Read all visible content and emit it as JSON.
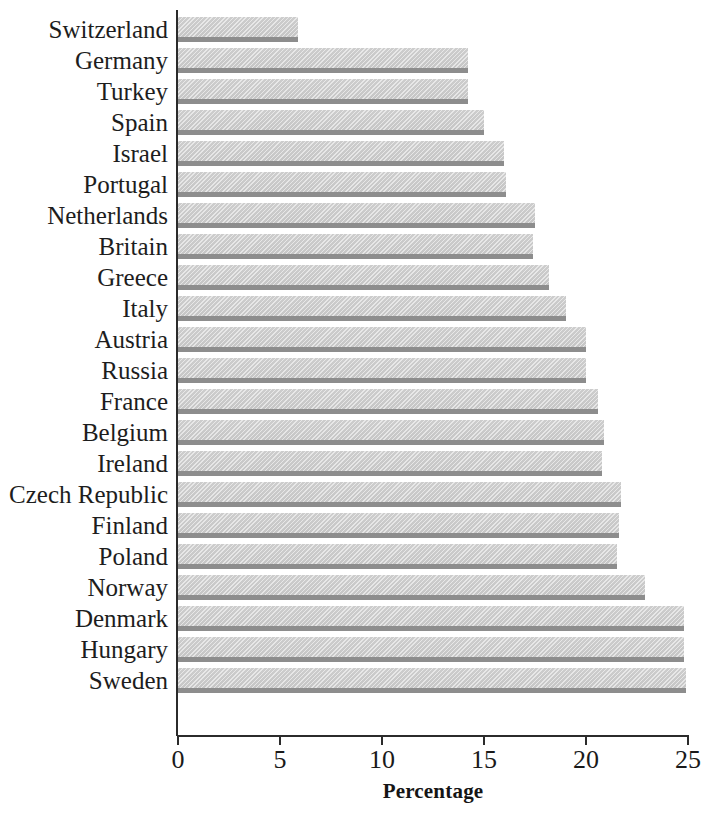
{
  "chart_data": {
    "type": "bar",
    "orientation": "horizontal",
    "title": "",
    "subtitle": "",
    "xlabel": "Percentage",
    "ylabel": "",
    "xlim": [
      0,
      25
    ],
    "xticks": [
      0,
      5,
      10,
      15,
      20,
      25
    ],
    "xtick_labels": [
      "0",
      "5",
      "10",
      "15",
      "20",
      "25"
    ],
    "grid": false,
    "legend": null,
    "bar_color": "#c8c8c8",
    "bar_edge_color": "#8d8d8d",
    "axis_color": "#2b2b2b",
    "background_color": "#ffffff",
    "categories": [
      "Switzerland",
      "Germany",
      "Turkey",
      "Spain",
      "Israel",
      "Portugal",
      "Netherlands",
      "Britain",
      "Greece",
      "Italy",
      "Austria",
      "Russia",
      "France",
      "Belgium",
      "Ireland",
      "Czech Republic",
      "Finland",
      "Poland",
      "Norway",
      "Denmark",
      "Hungary",
      "Sweden"
    ],
    "values": [
      5.9,
      14.2,
      14.2,
      15.0,
      16.0,
      16.1,
      17.5,
      17.4,
      18.2,
      19.0,
      20.0,
      20.0,
      20.6,
      20.9,
      20.8,
      21.7,
      21.6,
      21.5,
      22.9,
      24.8,
      24.8,
      24.9
    ]
  }
}
